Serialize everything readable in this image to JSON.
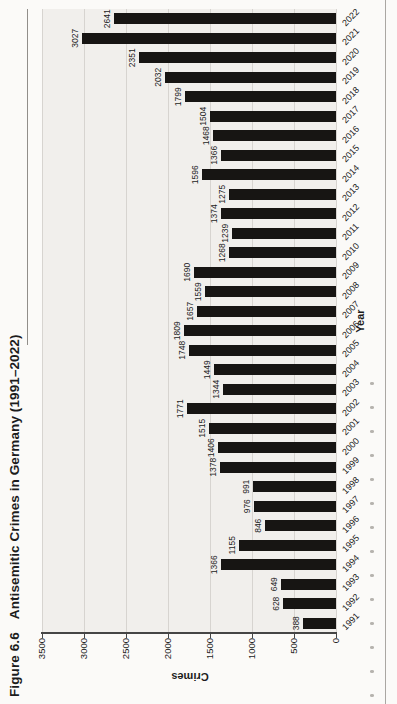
{
  "figure": {
    "label": "Figure 6.6",
    "title": "Antisemitic Crimes in Germany (1991–2022)"
  },
  "chart_data": {
    "type": "bar",
    "xlabel": "Year",
    "ylabel": "Crimes",
    "categories": [
      "1991",
      "1992",
      "1993",
      "1994",
      "1995",
      "1996",
      "1997",
      "1998",
      "1999",
      "2000",
      "2001",
      "2002",
      "2003",
      "2004",
      "2005",
      "2006",
      "2007",
      "2008",
      "2009",
      "2010",
      "2011",
      "2012",
      "2013",
      "2014",
      "2015",
      "2016",
      "2017",
      "2018",
      "2019",
      "2020",
      "2021",
      "2022"
    ],
    "values": [
      388,
      628,
      649,
      1366,
      1155,
      846,
      976,
      991,
      1378,
      1406,
      1515,
      1771,
      1344,
      1449,
      1748,
      1809,
      1657,
      1559,
      1690,
      1268,
      1239,
      1374,
      1275,
      1596,
      1366,
      1468,
      1504,
      1799,
      2032,
      2351,
      3027,
      2641
    ],
    "ylim": [
      0,
      3500
    ],
    "yticks": [
      0,
      500,
      1000,
      1500,
      2000,
      2500,
      3000,
      3500
    ],
    "grid": true,
    "legend": "none",
    "value_labels_shown": true,
    "category_label_rotation_deg": 45,
    "page_orientation": "figure rotated 90° counter-clockwise on page"
  },
  "colors": {
    "paper": "#fbfaf8",
    "plot_background": "#f1efec",
    "gridline": "#d7d4d0",
    "axis_line": "#454545",
    "bar": "#171513",
    "text": "#1c1c1c",
    "title_rule": "#918e8a",
    "bottom_rule": "#aaa7a3"
  }
}
